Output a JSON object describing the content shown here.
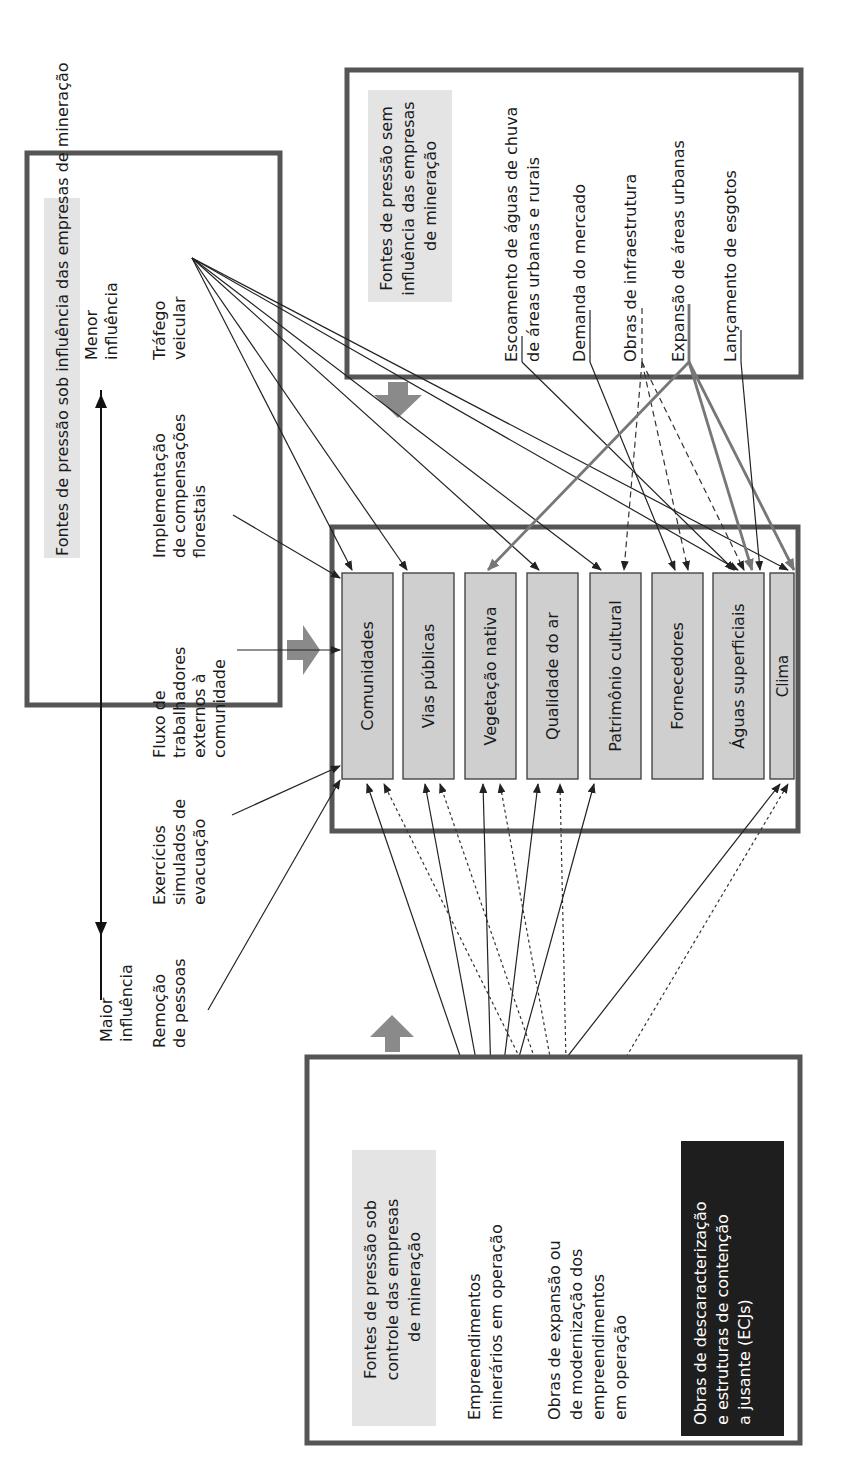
{
  "diagram": {
    "orientation": "rotated-90-ccw",
    "influence_box": {
      "title": "Fontes de pressão sob influência das empresas de mineração",
      "scale_low": [
        "Menor",
        "influência"
      ],
      "scale_high": [
        "Maior",
        "influência"
      ],
      "sources": [
        {
          "id": "trafego",
          "lines": [
            "Tráfego",
            "veicular"
          ]
        },
        {
          "id": "compensacoes",
          "lines": [
            "Implementação",
            "de compensações",
            "florestais"
          ]
        },
        {
          "id": "fluxo",
          "lines": [
            "Fluxo de",
            "trabalhadores",
            "externos à",
            "comunidade"
          ]
        },
        {
          "id": "exercicios",
          "lines": [
            "Exercícios",
            "simulados de",
            "evacuação"
          ]
        },
        {
          "id": "remocao",
          "lines": [
            "Remoção",
            "de pessoas"
          ]
        }
      ]
    },
    "no_influence_box": {
      "title_lines": [
        "Fontes de pressão sem",
        "influência das empresas",
        "de mineração"
      ],
      "sources": [
        {
          "id": "escoamento",
          "lines": [
            "Escoamento de águas de chuva",
            "de áreas urbanas e rurais"
          ]
        },
        {
          "id": "demanda",
          "lines": [
            "Demanda do mercado"
          ]
        },
        {
          "id": "obras_infra",
          "lines": [
            "Obras de infraestrutura"
          ]
        },
        {
          "id": "expansao_urbana",
          "lines": [
            "Expansão de áreas urbanas"
          ]
        },
        {
          "id": "esgotos",
          "lines": [
            "Lançamento de esgotos"
          ]
        }
      ]
    },
    "receptors": [
      "Comunidades",
      "Vias públicas",
      "Vegetação nativa",
      "Qualidade do ar",
      "Patrimônio cultural",
      "Fornecedores",
      "Águas superficiais",
      "Clima"
    ],
    "controlled_box": {
      "title_lines": [
        "Fontes de pressão sob",
        "controle das empresas",
        "de mineração"
      ],
      "sources": [
        {
          "id": "empreendimentos",
          "lines": [
            "Empreendimentos",
            "minerários em operação"
          ],
          "line_style": "solid"
        },
        {
          "id": "obras_expansao",
          "lines": [
            "Obras de expansão ou",
            "de modernização dos",
            "empreendimentos",
            "em operação"
          ],
          "line_style": "dotted"
        }
      ],
      "highlight": {
        "lines": [
          "Obras de descaracterização",
          "e estruturas de contenção",
          "a jusante (ECJs)"
        ],
        "bg": "#1e1e1e",
        "fg": "#ffffff"
      }
    },
    "connections": {
      "trafego": [
        "Comunidades",
        "Vias públicas",
        "Qualidade do ar",
        "Patrimônio cultural",
        "Águas superficiais",
        "Clima"
      ],
      "compensacoes": [
        "Comunidades"
      ],
      "fluxo": [
        "Comunidades"
      ],
      "exercicios": [
        "Comunidades"
      ],
      "remocao": [
        "Comunidades"
      ],
      "escoamento": [
        "Águas superficiais"
      ],
      "demanda": [
        "Fornecedores"
      ],
      "obras_infra": [
        "Patrimônio cultural",
        "Fornecedores",
        "Águas superficiais"
      ],
      "expansao_urbana": [
        "Vegetação nativa",
        "Águas superficiais",
        "Clima"
      ],
      "esgotos": [
        "Águas superficiais"
      ],
      "empreendimentos": [
        "Comunidades",
        "Vias públicas",
        "Vegetação nativa",
        "Qualidade do ar",
        "Patrimônio cultural",
        "Clima"
      ],
      "obras_expansao": [
        "Comunidades",
        "Vias públicas",
        "Vegetação nativa",
        "Qualidade do ar",
        "Clima"
      ]
    },
    "colors": {
      "frame": "#555555",
      "receptor_fill": "#cfcfcf",
      "title_highlight": "#e4e4e4",
      "big_arrow": "#8a8a8a"
    }
  }
}
